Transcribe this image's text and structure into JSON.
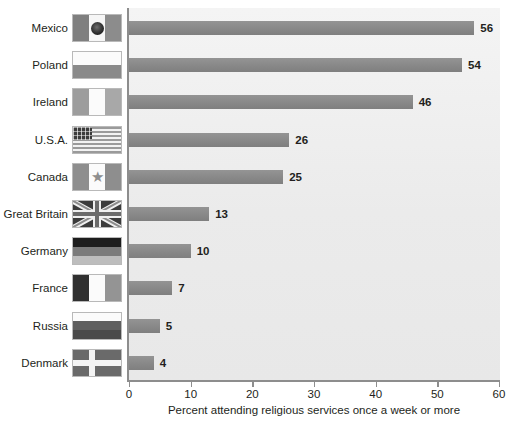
{
  "chart_data": {
    "type": "bar",
    "orientation": "horizontal",
    "title": "",
    "xlabel": "Percent attending religious services once a week or more",
    "ylabel": "",
    "xlim": [
      0,
      60
    ],
    "xticks": [
      0,
      10,
      20,
      30,
      40,
      50,
      60
    ],
    "grid": false,
    "legend": null,
    "categories": [
      "Mexico",
      "Poland",
      "Ireland",
      "U.S.A.",
      "Canada",
      "Great Britain",
      "Germany",
      "France",
      "Russia",
      "Denmark"
    ],
    "values": [
      56,
      54,
      46,
      26,
      25,
      13,
      10,
      7,
      5,
      4
    ],
    "value_labels": [
      "56",
      "54",
      "46",
      "26",
      "25",
      "13",
      "10",
      "7",
      "5",
      "4"
    ],
    "bar_color": "#8b8b8b",
    "plot_background": "#ececec"
  },
  "axis": {
    "tick_labels": [
      "0",
      "10",
      "20",
      "30",
      "40",
      "50",
      "60"
    ],
    "x_title": "Percent attending religious services once a week or more"
  },
  "rows": [
    {
      "country": "Mexico",
      "value_label": "56",
      "value": 56,
      "flag": "flag-mexico"
    },
    {
      "country": "Poland",
      "value_label": "54",
      "value": 54,
      "flag": "flag-poland"
    },
    {
      "country": "Ireland",
      "value_label": "46",
      "value": 46,
      "flag": "flag-ireland"
    },
    {
      "country": "U.S.A.",
      "value_label": "26",
      "value": 26,
      "flag": "flag-usa"
    },
    {
      "country": "Canada",
      "value_label": "25",
      "value": 25,
      "flag": "flag-canada"
    },
    {
      "country": "Great Britain",
      "value_label": "13",
      "value": 13,
      "flag": "flag-great-britain"
    },
    {
      "country": "Germany",
      "value_label": "10",
      "value": 10,
      "flag": "flag-germany"
    },
    {
      "country": "France",
      "value_label": "7",
      "value": 7,
      "flag": "flag-france"
    },
    {
      "country": "Russia",
      "value_label": "5",
      "value": 5,
      "flag": "flag-russia"
    },
    {
      "country": "Denmark",
      "value_label": "4",
      "value": 4,
      "flag": "flag-denmark"
    }
  ]
}
